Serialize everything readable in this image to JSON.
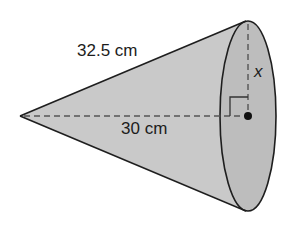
{
  "figure": {
    "shape": "right circular cone (lying on its side)",
    "labels": {
      "slant_height": "32.5 cm",
      "height": "30 cm",
      "radius": "x"
    },
    "markers": {
      "right_angle": "right-angle-marker",
      "center_point": "center-dot"
    },
    "colors": {
      "cone_fill": "#c9c9c9",
      "base_fill": "#bdbdbd",
      "outline": "#1e1e1e",
      "dashed": "#555555",
      "background": "#ffffff"
    }
  }
}
